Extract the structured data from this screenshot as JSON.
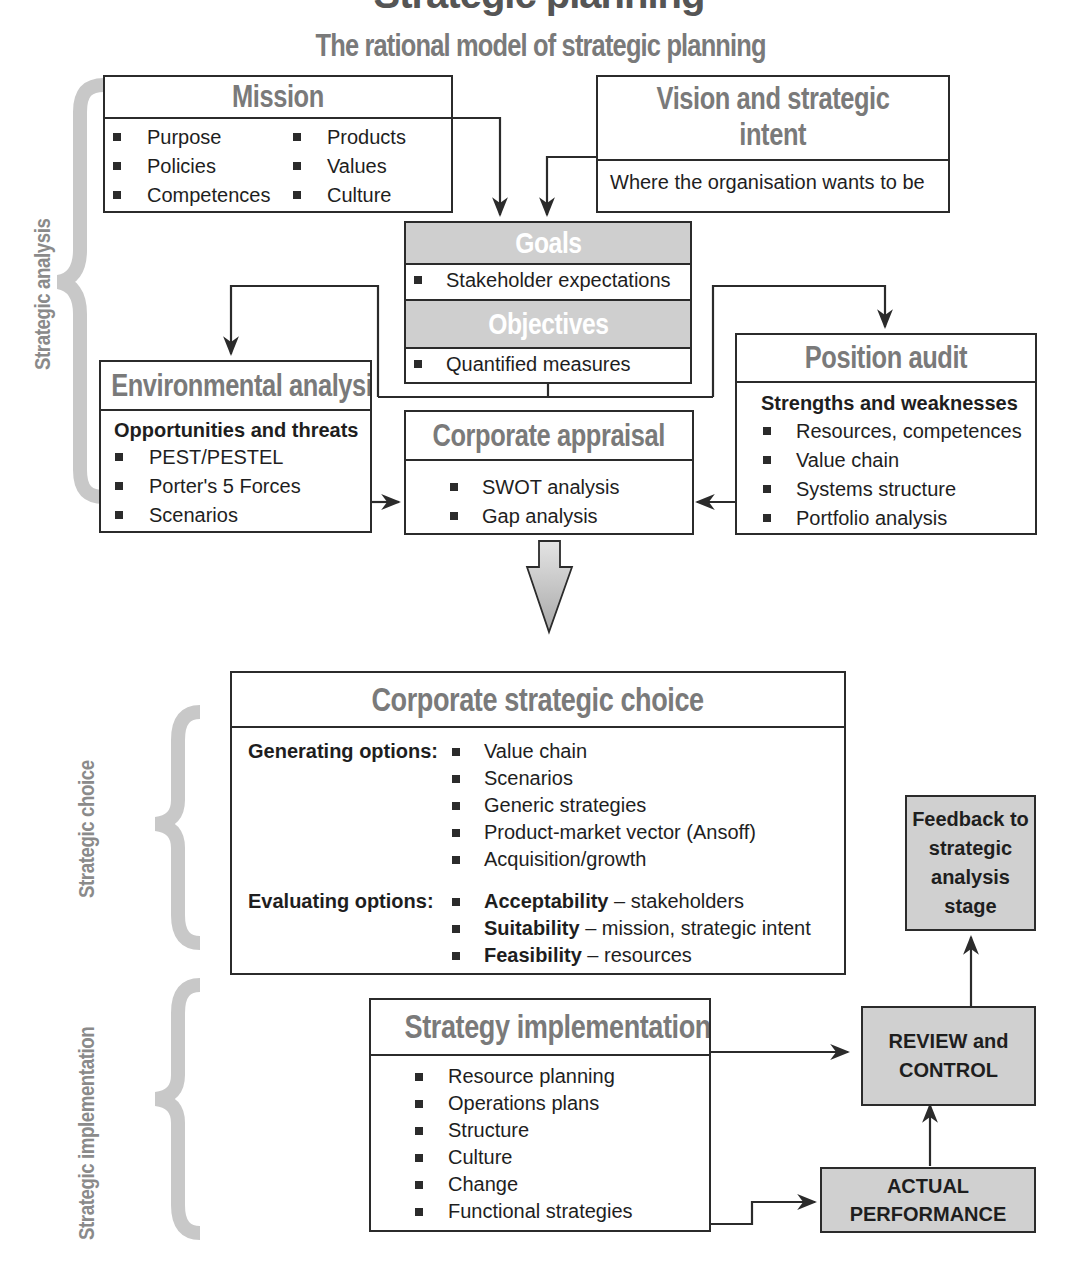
{
  "page": {
    "clipped_title": "Strategic planning",
    "title": "The rational model of strategic planning"
  },
  "side_labels": {
    "analysis": "Strategic analysis",
    "choice": "Strategic choice",
    "implementation": "Strategic implementation"
  },
  "mission": {
    "title": "Mission",
    "col1": [
      "Purpose",
      "Policies",
      "Competences"
    ],
    "col2": [
      "Products",
      "Values",
      "Culture"
    ]
  },
  "vision": {
    "title_line1": "Vision and strategic",
    "title_line2": "intent",
    "body": "Where the organisation wants to be"
  },
  "goals": {
    "title": "Goals",
    "item": "Stakeholder expectations"
  },
  "objectives": {
    "title": "Objectives",
    "item": "Quantified measures"
  },
  "environmental": {
    "title": "Environmental analysis",
    "subtitle": "Opportunities and threats",
    "items": [
      "PEST/PESTEL",
      "Porter's 5 Forces",
      "Scenarios"
    ]
  },
  "appraisal": {
    "title": "Corporate appraisal",
    "items": [
      "SWOT analysis",
      "Gap analysis"
    ]
  },
  "position": {
    "title": "Position audit",
    "subtitle": "Strengths and weaknesses",
    "items": [
      "Resources, competences",
      "Value chain",
      "Systems structure",
      "Portfolio analysis"
    ]
  },
  "choice": {
    "title": "Corporate strategic choice",
    "generating_label": "Generating options:",
    "generating": [
      "Value chain",
      "Scenarios",
      "Generic strategies",
      "Product-market vector (Ansoff)",
      "Acquisition/growth"
    ],
    "evaluating_label": "Evaluating options:",
    "evaluating": [
      {
        "bold": "Acceptability",
        "rest": " – stakeholders"
      },
      {
        "bold": "Suitability",
        "rest": " – mission, strategic intent"
      },
      {
        "bold": "Feasibility",
        "rest": " – resources"
      }
    ]
  },
  "implementation": {
    "title": "Strategy implementation",
    "items": [
      "Resource planning",
      "Operations plans",
      "Structure",
      "Culture",
      "Change",
      "Functional strategies"
    ]
  },
  "feedback": {
    "lines": [
      "Feedback to",
      "strategic",
      "analysis",
      "stage"
    ]
  },
  "review": {
    "lines": [
      "REVIEW and",
      "CONTROL"
    ]
  },
  "actual": {
    "lines": [
      "ACTUAL",
      "PERFORMANCE"
    ]
  },
  "colors": {
    "line": "#2b2b2b",
    "heading_gray": "#7a7a7a",
    "shade": "#d0d0d0",
    "brace": "#c8c8c8"
  }
}
